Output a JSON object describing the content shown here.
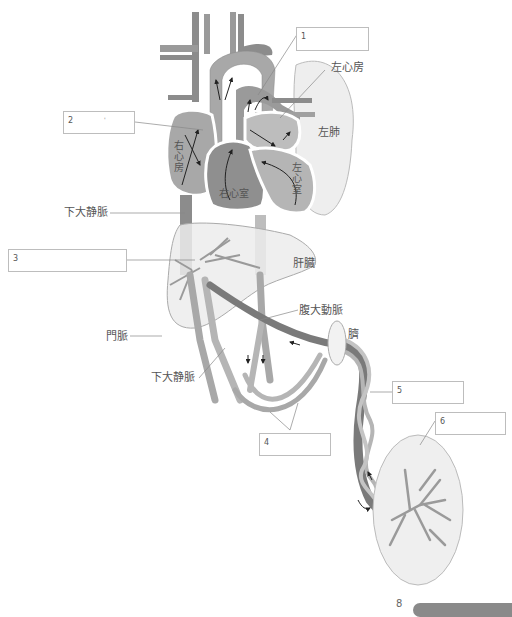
{
  "diagram": {
    "labels": {
      "left_atrium": "左心房",
      "left_lung": "左肺",
      "right_atrium": "右心房",
      "right_ventricle": "右心室",
      "left_ventricle": "左心室",
      "ivc_upper": "下大静脈",
      "liver": "肝臓",
      "abdominal_aorta": "腹大動脈",
      "portal_vein": "門脈",
      "ivc_lower": "下大静脈",
      "navel": "臍"
    },
    "answer_boxes": [
      {
        "number": "1",
        "value": ""
      },
      {
        "number": "2",
        "value": "",
        "mark": "'"
      },
      {
        "number": "3",
        "value": ""
      },
      {
        "number": "4",
        "value": ""
      },
      {
        "number": "5",
        "value": ""
      },
      {
        "number": "6",
        "value": ""
      }
    ],
    "footer": {
      "page_mark": "8",
      "badge_text": ""
    },
    "colors": {
      "dark_vessel": "#7a7a7a",
      "mid_vessel": "#a6a6a6",
      "light_vessel": "#c4c4c4",
      "organ_fill": "#efefef",
      "outline": "#9a9a9a"
    }
  }
}
